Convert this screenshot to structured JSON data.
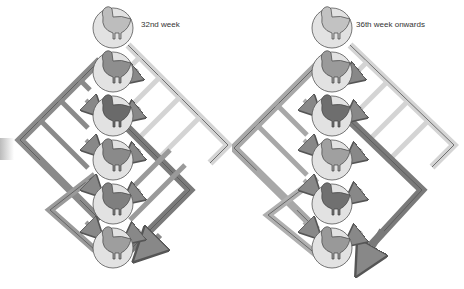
{
  "panels": [
    {
      "caption": "32nd week",
      "birds": 6,
      "bird_shades": [
        "#bdbdbd",
        "#8e8e8e",
        "#6a6a6a",
        "#8a8a8a",
        "#7f7f7f",
        "#9e9e9e"
      ]
    },
    {
      "caption": "36th week onwards",
      "birds": 6,
      "bird_shades": [
        "#c2c2c2",
        "#9a9a9a",
        "#6e6e6e",
        "#a0a0a0",
        "#707070",
        "#999999"
      ]
    }
  ],
  "colors": {
    "frame_light": "#d4d4d4",
    "frame_mid": "#a8a8a8",
    "frame_dark": "#7a7a7a",
    "outline": "#555555",
    "circle_fill": "#e2e2e2"
  }
}
